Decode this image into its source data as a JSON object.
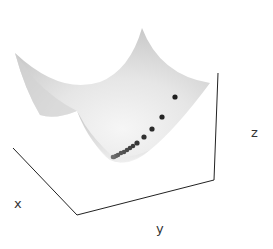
{
  "chart_data": {
    "type": "scatter3d-surface",
    "title": "",
    "xlabel": "x",
    "ylabel": "y",
    "zlabel": "z",
    "surface": {
      "description": "convex paraboloid bowl, light gray shading",
      "color": "#d8d8d8"
    },
    "grid": false,
    "ticks": false,
    "legend": null,
    "series": [
      {
        "name": "optimization trajectory",
        "description": "descent path points sliding down the bowl toward its minimum, spacing shrinking as they converge",
        "color_start": "#1f1f1f",
        "color_end": "#6e6e6e",
        "points_screen": [
          [
            175,
            97
          ],
          [
            162,
            117
          ],
          [
            152,
            129
          ],
          [
            144,
            137
          ],
          [
            137,
            143
          ],
          [
            133,
            146
          ],
          [
            130,
            148
          ],
          [
            127,
            150
          ],
          [
            124,
            152
          ],
          [
            121,
            153
          ],
          [
            118,
            155
          ],
          [
            116,
            156
          ],
          [
            114,
            157
          ],
          [
            113,
            157
          ]
        ]
      }
    ]
  },
  "axes": {
    "x_label": "x",
    "y_label": "y",
    "z_label": "z"
  }
}
